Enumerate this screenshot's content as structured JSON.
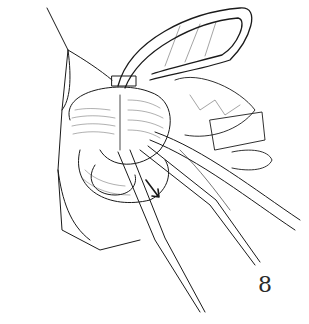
{
  "figure": {
    "number": "8",
    "colors": {
      "ink": "#1a1a1a",
      "background": "#ffffff",
      "tissue_shade": "#cfcfcf"
    }
  }
}
